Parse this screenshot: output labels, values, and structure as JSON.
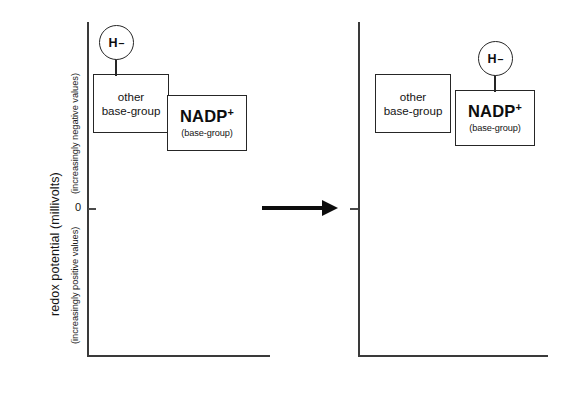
{
  "figure": {
    "axis": {
      "title": "redox potential (millivolts)",
      "upper_caption": "(increasingly negative values)",
      "lower_caption": "(increasingly positive values)",
      "zero_label": "0"
    },
    "arrow": {
      "name": "reaction-arrow",
      "direction": "right"
    },
    "hydride": {
      "symbol": "H",
      "charge": "–"
    },
    "panels": [
      {
        "id": "before",
        "name": "left-panel",
        "boxes": [
          {
            "id": "other-base-group",
            "line1": "other",
            "line2": "base-group",
            "has_hydride": true
          },
          {
            "id": "nadp",
            "main": "NADP",
            "charge": "+",
            "sub": "(base-group)",
            "has_hydride": false
          }
        ]
      },
      {
        "id": "after",
        "name": "right-panel",
        "boxes": [
          {
            "id": "other-base-group",
            "line1": "other",
            "line2": "base-group",
            "has_hydride": false
          },
          {
            "id": "nadp",
            "main": "NADP",
            "charge": "+",
            "sub": "(base-group)",
            "has_hydride": true
          }
        ]
      }
    ]
  }
}
